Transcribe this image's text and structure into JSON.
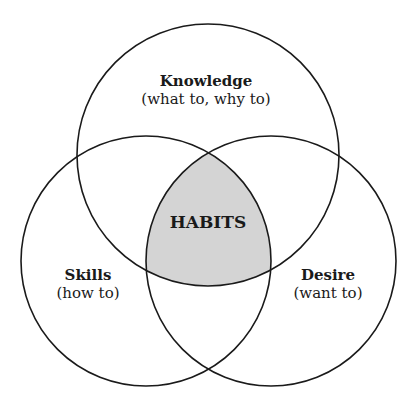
{
  "diagram": {
    "type": "venn",
    "colors": {
      "stroke": "#1a1a1a",
      "intersection_fill": "#d4d4d4",
      "background": "#ffffff"
    },
    "circles": [
      {
        "id": "knowledge",
        "title": "Knowledge",
        "subtitle": "(what to, why to)"
      },
      {
        "id": "skills",
        "title": "Skills",
        "subtitle": "(how to)"
      },
      {
        "id": "desire",
        "title": "Desire",
        "subtitle": "(want to)"
      }
    ],
    "intersection": {
      "label": "HABITS"
    }
  }
}
